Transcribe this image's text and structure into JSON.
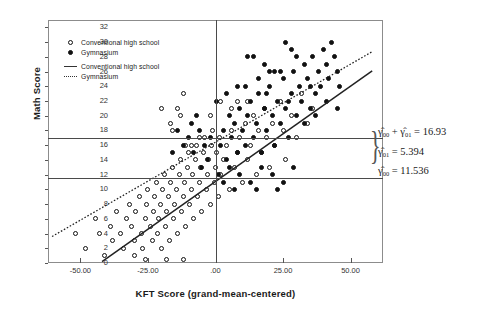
{
  "chart_data": {
    "type": "scatter",
    "title": "",
    "xlabel": "KFT Score (grand-mean-centered)",
    "ylabel": "Math Score",
    "xlim": [
      -62,
      62
    ],
    "ylim": [
      0,
      33
    ],
    "xticks": [
      "-50.00",
      "-25.00",
      ".00",
      "25.00",
      "50.00"
    ],
    "xtick_values": [
      -50,
      -25,
      0,
      25,
      50
    ],
    "yticks": [
      "0",
      "2",
      "4",
      "6",
      "8",
      "10",
      "12",
      "14",
      "16",
      "18",
      "20",
      "22",
      "24",
      "26",
      "28",
      "30",
      "32"
    ],
    "ytick_values": [
      0,
      2,
      4,
      6,
      8,
      10,
      12,
      14,
      16,
      18,
      20,
      22,
      24,
      26,
      28,
      30,
      32
    ],
    "grid": false,
    "legend_position": "top-left",
    "legend": [
      {
        "symbol": "open-circle",
        "label": "Conventional high school"
      },
      {
        "symbol": "filled-circle",
        "label": "Gymnasium"
      },
      {
        "symbol": "solid-line",
        "label": "Conventional high school"
      },
      {
        "symbol": "dotted-line",
        "label": "Gymnasium"
      }
    ],
    "reference_lines": [
      {
        "name": "intercept-gymnasium",
        "orientation": "horizontal",
        "value": 16.93,
        "label": "16.93"
      },
      {
        "name": "intercept-conventional",
        "orientation": "horizontal",
        "value": 11.536,
        "label": "11.536"
      },
      {
        "name": "center-line",
        "orientation": "vertical",
        "value": 0,
        "label": ".00"
      }
    ],
    "fit_lines": [
      {
        "name": "conventional-high-school",
        "style": "solid",
        "x0": -42.0,
        "y0": 0.2,
        "x1": 58.0,
        "y1": 26.1
      },
      {
        "name": "gymnasium",
        "style": "dotted",
        "x0": -60.5,
        "y0": 3.6,
        "x1": 58.0,
        "y1": 28.7
      }
    ],
    "annotations": [
      {
        "name": "gamma00-plus-gamma01",
        "text": "γ̂₀₀ + γ̂₀₁ = 16.93",
        "value": 16.93
      },
      {
        "name": "gamma01",
        "text": "γ̂₀₁ = 5.394",
        "value": 5.394
      },
      {
        "name": "gamma00",
        "text": "γ̂₀₀ = 11.536",
        "value": 11.536
      }
    ],
    "series": [
      {
        "name": "Conventional high school",
        "marker": "open-circle",
        "points": [
          [
            -52.0,
            4.0
          ],
          [
            -48.0,
            2.0
          ],
          [
            -44.5,
            6.0
          ],
          [
            -43.0,
            4.0
          ],
          [
            -41.0,
            1.0
          ],
          [
            -39.0,
            5.0
          ],
          [
            -38.0,
            3.0
          ],
          [
            -36.5,
            7.0
          ],
          [
            -35.0,
            4.0
          ],
          [
            -34.0,
            2.0
          ],
          [
            -33.0,
            6.0
          ],
          [
            -32.0,
            8.0
          ],
          [
            -31.0,
            5.0
          ],
          [
            -30.0,
            3.0
          ],
          [
            -29.5,
            7.0
          ],
          [
            -28.0,
            9.0
          ],
          [
            -27.5,
            4.0
          ],
          [
            -27.0,
            2.0
          ],
          [
            -26.0,
            6.0
          ],
          [
            -25.5,
            8.0
          ],
          [
            -25.0,
            10.0
          ],
          [
            -24.0,
            5.0
          ],
          [
            -23.5,
            3.0
          ],
          [
            -23.0,
            7.0
          ],
          [
            -22.5,
            9.0
          ],
          [
            -22.0,
            11.0
          ],
          [
            -21.5,
            4.0
          ],
          [
            -21.0,
            6.0
          ],
          [
            -20.5,
            8.0
          ],
          [
            -20.0,
            2.0
          ],
          [
            -19.5,
            10.0
          ],
          [
            -19.0,
            12.0
          ],
          [
            -18.5,
            5.0
          ],
          [
            -18.0,
            7.0
          ],
          [
            -17.5,
            9.0
          ],
          [
            -17.0,
            3.0
          ],
          [
            -16.5,
            11.0
          ],
          [
            -16.0,
            13.0
          ],
          [
            -15.5,
            6.0
          ],
          [
            -15.0,
            8.0
          ],
          [
            -14.5,
            10.0
          ],
          [
            -14.0,
            4.0
          ],
          [
            -13.5,
            12.0
          ],
          [
            -13.0,
            14.0
          ],
          [
            -12.5,
            7.0
          ],
          [
            -12.0,
            9.0
          ],
          [
            -11.5,
            11.0
          ],
          [
            -11.0,
            5.0
          ],
          [
            -10.5,
            13.0
          ],
          [
            -10.0,
            15.0
          ],
          [
            -9.5,
            8.0
          ],
          [
            -9.0,
            10.0
          ],
          [
            -8.5,
            12.0
          ],
          [
            -8.0,
            6.0
          ],
          [
            -7.5,
            14.0
          ],
          [
            -7.0,
            16.0
          ],
          [
            -6.5,
            9.0
          ],
          [
            -6.0,
            11.0
          ],
          [
            -5.5,
            13.0
          ],
          [
            -5.0,
            7.0
          ],
          [
            -4.5,
            15.0
          ],
          [
            -4.0,
            17.0
          ],
          [
            -3.5,
            10.0
          ],
          [
            -3.0,
            12.0
          ],
          [
            -2.5,
            14.0
          ],
          [
            -2.0,
            8.0
          ],
          [
            -1.5,
            16.0
          ],
          [
            -1.0,
            18.0
          ],
          [
            -0.5,
            11.0
          ],
          [
            0.0,
            13.0
          ],
          [
            0.5,
            15.0
          ],
          [
            1.0,
            9.0
          ],
          [
            1.5,
            17.0
          ],
          [
            2.0,
            12.0
          ],
          [
            3.0,
            14.0
          ],
          [
            4.0,
            16.0
          ],
          [
            5.0,
            10.0
          ],
          [
            6.0,
            18.0
          ],
          [
            7.0,
            13.0
          ],
          [
            8.0,
            15.0
          ],
          [
            9.0,
            17.0
          ],
          [
            10.0,
            11.0
          ],
          [
            11.0,
            19.0
          ],
          [
            12.0,
            14.0
          ],
          [
            13.0,
            16.0
          ],
          [
            14.0,
            20.0
          ],
          [
            15.0,
            12.0
          ],
          [
            16.0,
            18.0
          ],
          [
            17.0,
            15.0
          ],
          [
            18.0,
            21.0
          ],
          [
            19.0,
            17.0
          ],
          [
            20.0,
            13.0
          ],
          [
            21.0,
            19.0
          ],
          [
            22.0,
            16.0
          ],
          [
            24.0,
            22.0
          ],
          [
            25.0,
            18.0
          ],
          [
            26.0,
            14.0
          ],
          [
            28.0,
            20.0
          ],
          [
            30.0,
            17.0
          ],
          [
            32.0,
            23.0
          ],
          [
            34.0,
            19.0
          ],
          [
            36.0,
            21.0
          ],
          [
            -20.0,
            21.0
          ],
          [
            -14.0,
            21.0
          ],
          [
            -16.5,
            19.0
          ],
          [
            -16.0,
            18.0
          ],
          [
            -13.0,
            20.0
          ],
          [
            -12.0,
            23.0
          ],
          [
            -11.0,
            16.0
          ],
          [
            -9.0,
            16.0
          ],
          [
            -6.0,
            17.0
          ],
          [
            -2.0,
            20.0
          ],
          [
            2.0,
            22.0
          ],
          [
            6.0,
            21.0
          ],
          [
            8.0,
            22.0
          ],
          [
            12.0,
            22.0
          ],
          [
            -30.0,
            1.0
          ],
          [
            -26.0,
            0.5
          ],
          [
            -18.0,
            0.5
          ],
          [
            -12.0,
            0.5
          ]
        ]
      },
      {
        "name": "Gymnasium",
        "marker": "filled-circle",
        "points": [
          [
            2.0,
            16.0
          ],
          [
            3.0,
            18.0
          ],
          [
            4.0,
            14.0
          ],
          [
            5.0,
            20.0
          ],
          [
            6.0,
            17.0
          ],
          [
            7.0,
            19.0
          ],
          [
            8.0,
            15.0
          ],
          [
            9.0,
            21.0
          ],
          [
            10.0,
            18.0
          ],
          [
            11.0,
            16.0
          ],
          [
            12.0,
            20.0
          ],
          [
            13.0,
            22.0
          ],
          [
            14.0,
            17.0
          ],
          [
            15.0,
            19.0
          ],
          [
            16.0,
            23.0
          ],
          [
            17.0,
            15.0
          ],
          [
            18.0,
            21.0
          ],
          [
            19.0,
            18.0
          ],
          [
            20.0,
            24.0
          ],
          [
            21.0,
            20.0
          ],
          [
            22.0,
            16.0
          ],
          [
            23.0,
            22.0
          ],
          [
            24.0,
            19.0
          ],
          [
            25.0,
            25.0
          ],
          [
            26.0,
            21.0
          ],
          [
            27.0,
            17.0
          ],
          [
            28.0,
            23.0
          ],
          [
            29.0,
            26.0
          ],
          [
            30.0,
            20.0
          ],
          [
            31.0,
            24.0
          ],
          [
            32.0,
            22.0
          ],
          [
            33.0,
            27.0
          ],
          [
            34.0,
            25.0
          ],
          [
            35.0,
            21.0
          ],
          [
            36.0,
            28.0
          ],
          [
            37.0,
            23.0
          ],
          [
            38.0,
            26.0
          ],
          [
            39.0,
            24.0
          ],
          [
            40.0,
            29.0
          ],
          [
            41.0,
            27.0
          ],
          [
            42.0,
            25.0
          ],
          [
            43.0,
            30.0
          ],
          [
            44.0,
            28.0
          ],
          [
            45.0,
            26.0
          ],
          [
            46.0,
            24.0
          ],
          [
            12.0,
            28.0
          ],
          [
            14.0,
            28.0
          ],
          [
            20.0,
            26.0
          ],
          [
            22.0,
            26.0
          ],
          [
            24.0,
            26.0
          ],
          [
            18.0,
            27.0
          ],
          [
            28.0,
            29.0
          ],
          [
            30.0,
            28.0
          ],
          [
            26.0,
            30.0
          ],
          [
            -2.0,
            17.0
          ],
          [
            -4.0,
            16.0
          ],
          [
            -6.0,
            18.0
          ],
          [
            -8.0,
            15.0
          ],
          [
            -10.0,
            17.0
          ],
          [
            -12.0,
            16.0
          ],
          [
            -14.0,
            18.0
          ],
          [
            -16.0,
            15.0
          ],
          [
            -3.0,
            14.0
          ],
          [
            -5.0,
            13.0
          ],
          [
            -7.0,
            20.0
          ],
          [
            -9.0,
            19.0
          ],
          [
            1.0,
            12.0
          ],
          [
            3.0,
            11.0
          ],
          [
            5.0,
            13.0
          ],
          [
            9.0,
            12.0
          ],
          [
            13.0,
            11.0
          ],
          [
            17.0,
            13.0
          ],
          [
            21.0,
            12.0
          ],
          [
            25.0,
            11.0
          ],
          [
            29.0,
            13.0
          ],
          [
            7.0,
            10.0
          ],
          [
            15.0,
            10.0
          ],
          [
            23.0,
            10.0
          ],
          [
            0.5,
            22.0
          ],
          [
            4.0,
            23.0
          ],
          [
            8.0,
            24.0
          ],
          [
            16.0,
            25.0
          ],
          [
            33.0,
            19.0
          ],
          [
            37.0,
            20.0
          ],
          [
            41.0,
            22.0
          ],
          [
            45.0,
            21.0
          ],
          [
            11.0,
            24.0
          ],
          [
            19.0,
            23.0
          ],
          [
            27.0,
            22.0
          ],
          [
            35.0,
            24.0
          ]
        ]
      }
    ]
  }
}
